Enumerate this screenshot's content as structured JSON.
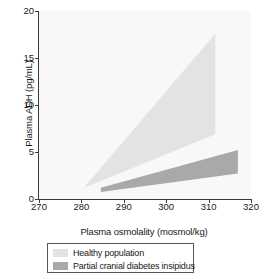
{
  "chart_data": {
    "type": "area",
    "title": "",
    "xlabel": "Plasma osmolality (mosmol/kg)",
    "ylabel": "Plasma ADH (pg/mL)",
    "xlim": [
      270,
      320
    ],
    "ylim": [
      0,
      20
    ],
    "xticks": [
      270,
      280,
      290,
      300,
      310,
      320
    ],
    "yticks": [
      0,
      5,
      10,
      15,
      20
    ],
    "grid": false,
    "legend_position": "below-axes",
    "series": [
      {
        "name": "Healthy population",
        "color": "#e3e3e3",
        "description": "Wedge-shaped reference band widening with rising plasma osmolality",
        "upper_bound": [
          {
            "x": 280.6,
            "y": 1.2
          },
          {
            "x": 311.6,
            "y": 17.6
          }
        ],
        "lower_bound": [
          {
            "x": 280.6,
            "y": 1.2
          },
          {
            "x": 311.6,
            "y": 6.9
          }
        ],
        "polygon": [
          {
            "x": 280.6,
            "y": 1.2
          },
          {
            "x": 311.6,
            "y": 17.6
          },
          {
            "x": 311.6,
            "y": 6.9
          }
        ]
      },
      {
        "name": "Partial cranial diabetes insipidus",
        "color": "#a9a9a9",
        "description": "Narrow wedge below the healthy band, blunted ADH response",
        "upper_bound": [
          {
            "x": 284.6,
            "y": 1.2
          },
          {
            "x": 316.9,
            "y": 5.2
          }
        ],
        "lower_bound": [
          {
            "x": 284.6,
            "y": 0.75
          },
          {
            "x": 316.9,
            "y": 2.7
          }
        ],
        "polygon": [
          {
            "x": 284.6,
            "y": 1.2
          },
          {
            "x": 316.9,
            "y": 5.2
          },
          {
            "x": 316.9,
            "y": 2.7
          },
          {
            "x": 284.6,
            "y": 0.75
          }
        ]
      }
    ]
  },
  "axes": {
    "y_title": "Plasma ADH (pg/mL)",
    "x_title": "Plasma osmolality (mosmol/kg)",
    "y_tick_labels": [
      "0",
      "5",
      "10",
      "15",
      "20"
    ],
    "x_tick_labels": [
      "270",
      "280",
      "290",
      "300",
      "310",
      "320"
    ]
  },
  "legend": {
    "items": [
      {
        "label": "Healthy population",
        "color": "#e3e3e3"
      },
      {
        "label": "Partial cranial diabetes insipidus",
        "color": "#a9a9a9"
      }
    ]
  },
  "colors": {
    "healthy": "#e3e3e3",
    "partial_cdi": "#a9a9a9",
    "axis": "#3a3a3a",
    "plot_background": "#f8f8f8",
    "text": "#1a1a1a"
  }
}
